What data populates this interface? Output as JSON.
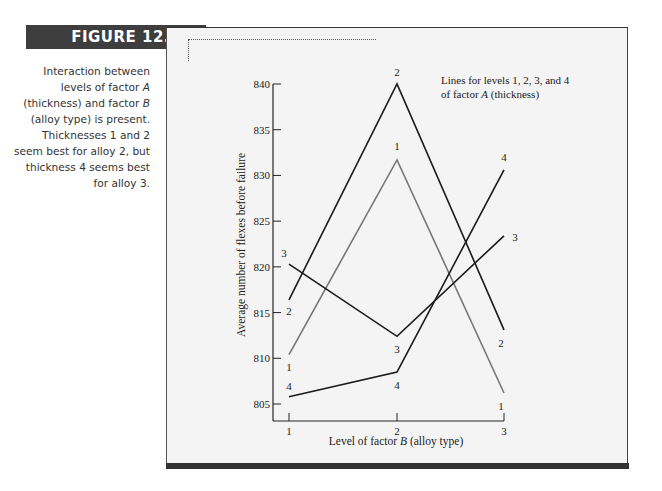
{
  "figure": {
    "label": "FIGURE 12.3",
    "caption_lines": [
      "Interaction between",
      "levels of factor A",
      "(thickness) and factor B",
      "(alloy type) is present.",
      "Thicknesses 1 and 2",
      "seem best for alloy 2, but",
      "thickness 4 seems best",
      "for alloy 3."
    ]
  },
  "chart_data": {
    "type": "line",
    "title": "",
    "annotation": [
      "Lines for levels 1, 2, 3, and 4",
      "of factor A (thickness)"
    ],
    "xlabel": "Level of factor B (alloy type)",
    "ylabel": "Average number of flexes before failure",
    "categories": [
      "1",
      "2",
      "3"
    ],
    "y_ticks": [
      805,
      810,
      815,
      820,
      825,
      830,
      835,
      840
    ],
    "ylim": [
      803,
      840
    ],
    "grid": false,
    "legend": "inline labels at each point",
    "series": [
      {
        "name": "1",
        "values": [
          810.4,
          831.7,
          806.2
        ],
        "color": "#777777"
      },
      {
        "name": "2",
        "values": [
          816.4,
          840.0,
          813.1
        ],
        "color": "#1a1a1a"
      },
      {
        "name": "3",
        "values": [
          820.3,
          812.4,
          823.4
        ],
        "color": "#1a1a1a"
      },
      {
        "name": "4",
        "values": [
          805.8,
          808.5,
          830.6
        ],
        "color": "#1a1a1a"
      }
    ]
  }
}
